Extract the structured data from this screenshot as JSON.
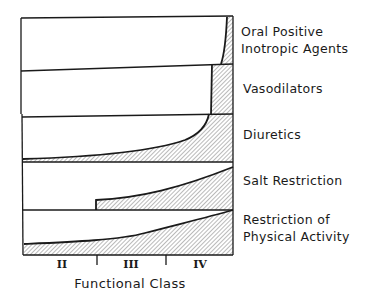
{
  "diagram": {
    "bands": [
      {
        "id": "oral-inotropic",
        "label_lines": [
          "Oral Positive",
          "Inotropic Agents"
        ]
      },
      {
        "id": "vasodilators",
        "label_lines": [
          "Vasodilators"
        ]
      },
      {
        "id": "diuretics",
        "label_lines": [
          "Diuretics"
        ]
      },
      {
        "id": "salt-restriction",
        "label_lines": [
          "Salt Restriction"
        ]
      },
      {
        "id": "physical-activity",
        "label_lines": [
          "Restriction of",
          "Physical Activity"
        ]
      }
    ],
    "x_axis": {
      "title": "Functional Class",
      "classes": [
        "II",
        "III",
        "IV"
      ]
    },
    "colors": {
      "ink": "#1a1a1a",
      "hatch": "#555555",
      "background": "#ffffff"
    }
  }
}
